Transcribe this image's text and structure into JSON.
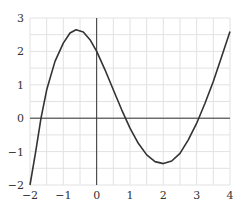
{
  "chart_data": {
    "type": "line",
    "title": "",
    "xlabel": "",
    "ylabel": "",
    "xlim": [
      -2,
      4
    ],
    "ylim": [
      -2,
      3
    ],
    "grid": true,
    "grid_step": 0.5,
    "x_ticks": [
      "-2",
      "-1",
      "0",
      "1",
      "2",
      "3",
      "4"
    ],
    "y_ticks": [
      "-2",
      "-1",
      "0",
      "1",
      "2",
      "3"
    ],
    "series": [
      {
        "name": "f(x)",
        "points": [
          [
            -2,
            -2
          ],
          [
            -1.83,
            -1.0
          ],
          [
            -1.67,
            0.0
          ],
          [
            -1.5,
            0.85
          ],
          [
            -1.25,
            1.7
          ],
          [
            -1.0,
            2.25
          ],
          [
            -0.8,
            2.55
          ],
          [
            -0.62,
            2.65
          ],
          [
            -0.4,
            2.58
          ],
          [
            -0.2,
            2.35
          ],
          [
            0,
            2.0
          ],
          [
            0.25,
            1.45
          ],
          [
            0.5,
            0.85
          ],
          [
            0.75,
            0.25
          ],
          [
            1.0,
            -0.3
          ],
          [
            1.25,
            -0.75
          ],
          [
            1.5,
            -1.1
          ],
          [
            1.75,
            -1.3
          ],
          [
            2.0,
            -1.36
          ],
          [
            2.25,
            -1.28
          ],
          [
            2.5,
            -1.05
          ],
          [
            2.75,
            -0.65
          ],
          [
            3.0,
            -0.15
          ],
          [
            3.25,
            0.45
          ],
          [
            3.5,
            1.1
          ],
          [
            3.75,
            1.85
          ],
          [
            4.0,
            2.6
          ]
        ]
      }
    ]
  },
  "colors": {
    "grid": "#e2e2e2",
    "axis": "#333333",
    "curve": "#333333"
  }
}
